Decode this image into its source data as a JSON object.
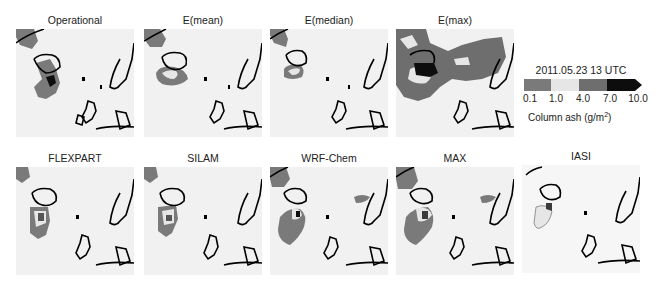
{
  "figure": {
    "panels": [
      {
        "id": "operational",
        "title": "Operational",
        "x": 16,
        "y": 14
      },
      {
        "id": "e-mean",
        "title": "E(mean)",
        "x": 144,
        "y": 14
      },
      {
        "id": "e-median",
        "title": "E(median)",
        "x": 270,
        "y": 14
      },
      {
        "id": "e-max",
        "title": "E(max)",
        "x": 396,
        "y": 14
      },
      {
        "id": "flexpart",
        "title": "FLEXPART",
        "x": 16,
        "y": 152
      },
      {
        "id": "silam",
        "title": "SILAM",
        "x": 144,
        "y": 152
      },
      {
        "id": "wrf-chem",
        "title": "WRF-Chem",
        "x": 270,
        "y": 152
      },
      {
        "id": "max",
        "title": "MAX",
        "x": 396,
        "y": 152
      },
      {
        "id": "iasi",
        "title": "IASI",
        "x": 522,
        "y": 150
      }
    ],
    "legend": {
      "date": "2011.05.23 13 UTC",
      "ticks": [
        "0.1",
        "1.0",
        "4.0",
        "7.0",
        "10.0"
      ],
      "label_prefix": "Column ash (g/m",
      "label_sup": "2",
      "label_suffix": ")",
      "colors": [
        "#7a7a7a",
        "#e6e6e6",
        "#6e6e6e",
        "#0d0d0d"
      ]
    }
  }
}
